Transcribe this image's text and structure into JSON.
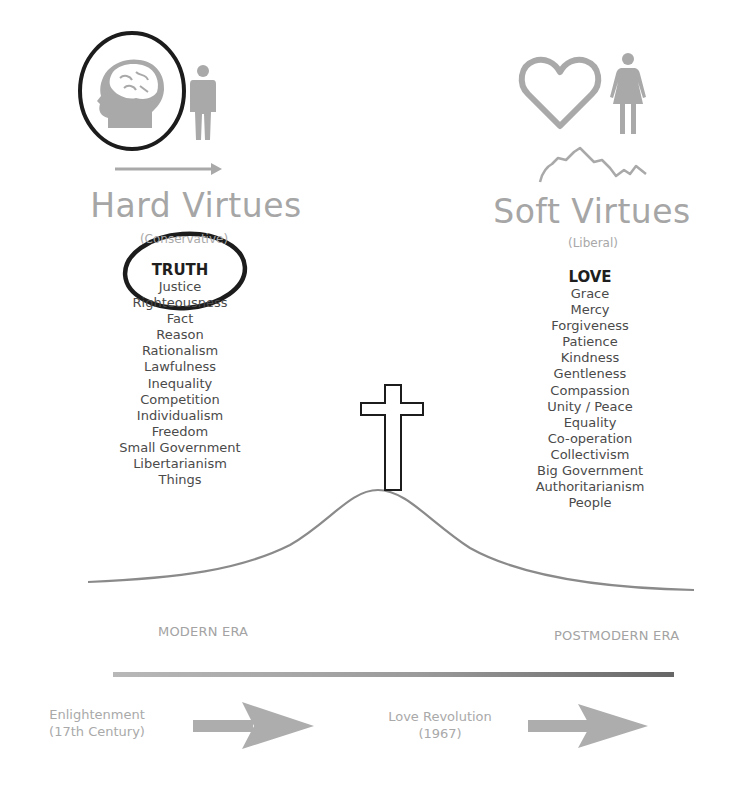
{
  "left": {
    "title": "Hard Virtues",
    "subtitle": "(Conservative)",
    "icons": [
      "brain-head-icon",
      "man-icon",
      "right-arrow-icon"
    ],
    "highlight_circle": "TRUTH",
    "virtues": [
      "TRUTH",
      "Justice",
      "Righteousness",
      "Fact",
      "Reason",
      "Rationalism",
      "Lawfulness",
      "Inequality",
      "Competition",
      "Individualism",
      "Freedom",
      "Small Government",
      "Libertarianism",
      "Things"
    ]
  },
  "right": {
    "title": "Soft Virtues",
    "subtitle": "(Liberal)",
    "icons": [
      "heart-icon",
      "woman-icon",
      "squiggle-line-icon"
    ],
    "virtues": [
      "LOVE",
      "Grace",
      "Mercy",
      "Forgiveness",
      "Patience",
      "Kindness",
      "Gentleness",
      "Compassion",
      "Unity / Peace",
      "Equality",
      "Co-operation",
      "Collectivism",
      "Big Government",
      "Authoritarianism",
      "People"
    ]
  },
  "center": {
    "icon": "cross-icon",
    "hill": "bell-curve"
  },
  "eras": {
    "left": "MODERN ERA",
    "right": "POSTMODERN ERA"
  },
  "timeline": {
    "bar_colors": {
      "start": "#b5b5b5",
      "end": "#6e6e6e"
    },
    "events": [
      {
        "line1": "Enlightenment",
        "line2": "(17th Century)"
      },
      {
        "line1": "Love Revolution",
        "line2": "(1967)"
      }
    ]
  },
  "colors": {
    "icon_grey": "#a9a9a9",
    "title_grey": "#a6a6a6",
    "text_dark": "#4a4a4a",
    "outline_black": "#1c1c1c"
  }
}
